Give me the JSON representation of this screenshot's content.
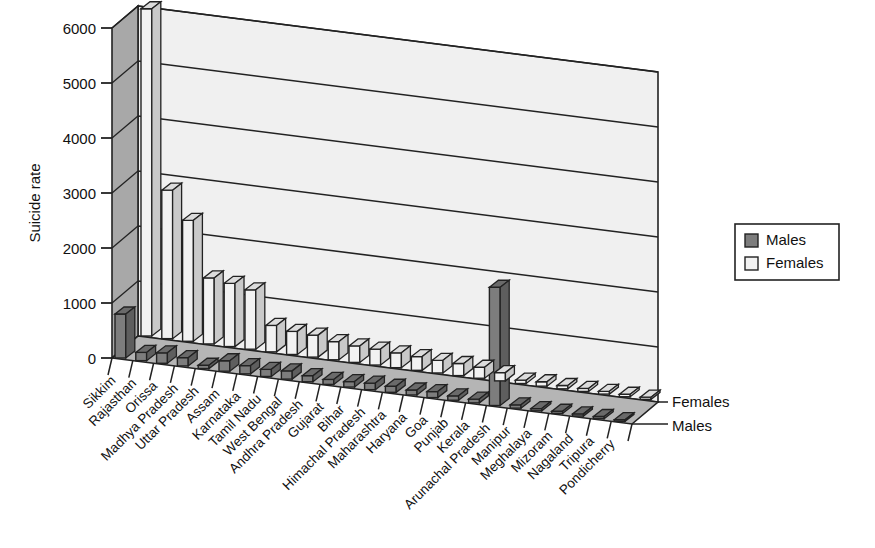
{
  "chart_data": {
    "type": "bar",
    "title": "",
    "subtitle": "",
    "xlabel": "",
    "ylabel": "Suicide rate",
    "zlabel": "",
    "ylim": [
      0,
      6000
    ],
    "yticks": [
      0,
      1000,
      2000,
      3000,
      4000,
      5000,
      6000
    ],
    "grid": true,
    "projection": "3d",
    "legend_position": "right",
    "legend_entries": [
      "Males",
      "Females"
    ],
    "depth_axis_labels": [
      "Females",
      "Males"
    ],
    "categories": [
      "Sikkim",
      "Rajasthan",
      "Orissa",
      "Madhya Pradesh",
      "Uttar Pradesh",
      "Assam",
      "Karnataka",
      "Tamil Nadu",
      "West Bengal",
      "Andhra Pradesh",
      "Gujarat",
      "Bihar",
      "Himachal Pradesh",
      "Maharashtra",
      "Haryana",
      "Goa",
      "Punjab",
      "Kerala",
      "Arunachal Pradesh",
      "Manipur",
      "Meghalaya",
      "Mizoram",
      "Nagaland",
      "Tripura",
      "Pondicherry"
    ],
    "series": [
      {
        "name": "Males",
        "color": "#7d7d7d",
        "values": [
          800,
          150,
          190,
          150,
          60,
          190,
          150,
          130,
          150,
          110,
          90,
          100,
          120,
          110,
          90,
          110,
          80,
          70,
          2150,
          60,
          40,
          40,
          40,
          40,
          30
        ]
      },
      {
        "name": "Females",
        "color": "#f2f2f2",
        "values": [
          5950,
          2700,
          2200,
          1200,
          1150,
          1080,
          480,
          420,
          400,
          330,
          300,
          290,
          270,
          250,
          230,
          220,
          200,
          150,
          60,
          80,
          60,
          55,
          50,
          45,
          40
        ]
      }
    ]
  },
  "legend": {
    "males_label": "Males",
    "females_label": "Females"
  },
  "axes": {
    "y_title": "Suicide rate",
    "depth_top_label": "Females",
    "depth_bottom_label": "Males"
  },
  "colors": {
    "male_bar": "#7d7d7d",
    "female_bar": "#f2f2f2",
    "back_wall": "#f0f0f0",
    "side_wall": "#a8a8a8",
    "floor": "#b5b5b5",
    "outline": "#222222",
    "text": "#111111"
  }
}
